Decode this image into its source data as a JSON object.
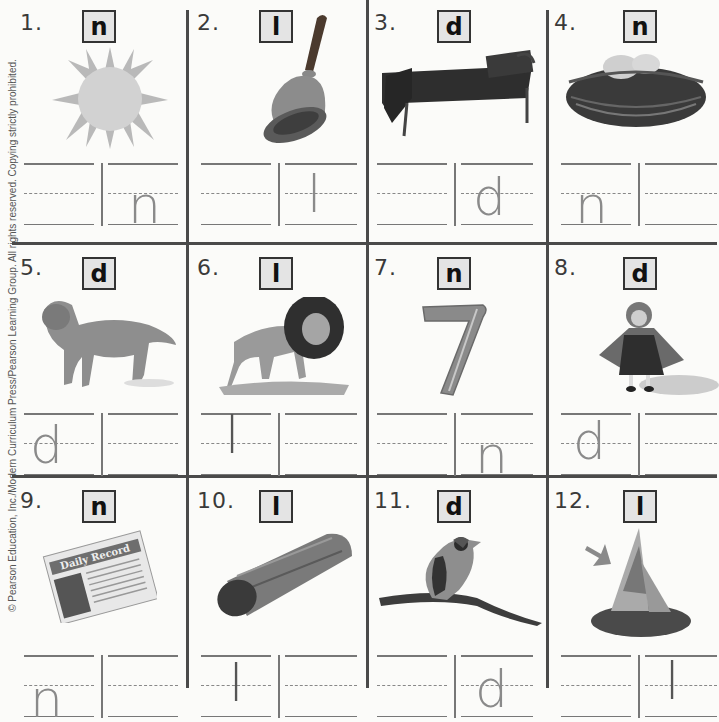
{
  "worksheet": {
    "copyright": "© Pearson Education, Inc./Modern Curriculum Press/Pearson Learning Group. All rights reserved. Copying strictly prohibited.",
    "items": [
      {
        "number": "1.",
        "letter": "n",
        "picture": "sun",
        "handwritten": "n",
        "written_box": 2
      },
      {
        "number": "2.",
        "letter": "l",
        "picture": "bell",
        "handwritten": "l",
        "written_box": 2
      },
      {
        "number": "3.",
        "letter": "d",
        "picture": "bed",
        "handwritten": "d",
        "written_box": 2
      },
      {
        "number": "4.",
        "letter": "n",
        "picture": "nest",
        "handwritten": "n",
        "written_box": 1
      },
      {
        "number": "5.",
        "letter": "d",
        "picture": "dog",
        "handwritten": "d",
        "written_box": 1
      },
      {
        "number": "6.",
        "letter": "l",
        "picture": "lion",
        "handwritten": "l",
        "written_box": 1
      },
      {
        "number": "7.",
        "letter": "n",
        "picture": "seven",
        "handwritten": "n",
        "written_box": 2
      },
      {
        "number": "8.",
        "letter": "d",
        "picture": "doll",
        "handwritten": "d",
        "written_box": 1
      },
      {
        "number": "9.",
        "letter": "n",
        "picture": "newspaper",
        "handwritten": "n",
        "written_box": 1
      },
      {
        "number": "10.",
        "letter": "l",
        "picture": "log",
        "handwritten": "l",
        "written_box": 1
      },
      {
        "number": "11.",
        "letter": "d",
        "picture": "bird",
        "handwritten": "d",
        "written_box": 2
      },
      {
        "number": "12.",
        "letter": "l",
        "picture": "sailboat",
        "handwritten": "l",
        "written_box": 2
      }
    ],
    "newspaper_headline": "Daily Record",
    "seven_label": "7"
  }
}
